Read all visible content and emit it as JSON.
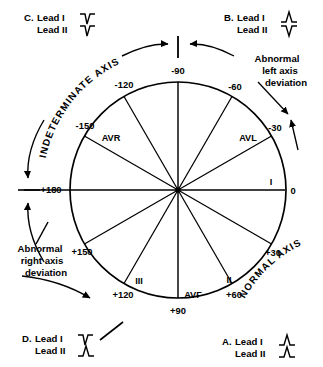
{
  "figure": {
    "circle": {
      "center_x": 178,
      "center_y": 190,
      "radius": 108
    },
    "degree_labels": [
      {
        "text": "-90",
        "angle": -90,
        "x": 178,
        "y": 74,
        "anchor": "middle"
      },
      {
        "text": "-120",
        "angle": -120,
        "x": 124,
        "y": 88,
        "anchor": "middle"
      },
      {
        "text": "-150",
        "angle": -150,
        "x": 85,
        "y": 129,
        "anchor": "middle"
      },
      {
        "text": "+180",
        "angle": 180,
        "x": 51,
        "y": 193,
        "anchor": "middle"
      },
      {
        "text": "+150",
        "angle": 150,
        "x": 82,
        "y": 255,
        "anchor": "middle"
      },
      {
        "text": "+120",
        "angle": 120,
        "x": 123,
        "y": 298,
        "anchor": "middle"
      },
      {
        "text": "+90",
        "angle": 90,
        "x": 178,
        "y": 313,
        "anchor": "middle"
      },
      {
        "text": "+60",
        "angle": 60,
        "x": 233,
        "y": 298,
        "anchor": "middle"
      },
      {
        "text": "+30",
        "angle": 30,
        "x": 272,
        "y": 256,
        "anchor": "middle"
      },
      {
        "text": "0",
        "angle": 0,
        "x": 292,
        "y": 194,
        "anchor": "middle"
      },
      {
        "text": "-30",
        "angle": -30,
        "x": 274,
        "y": 130,
        "anchor": "middle"
      },
      {
        "text": "-60",
        "angle": -60,
        "x": 234,
        "y": 89,
        "anchor": "middle"
      }
    ],
    "lead_labels": [
      {
        "text": "AVR",
        "angle": -150,
        "x": 111,
        "y": 138
      },
      {
        "text": "AVL",
        "angle": -30,
        "x": 247,
        "y": 139
      },
      {
        "text": "I",
        "angle": 0,
        "x": 271,
        "y": 185
      },
      {
        "text": "II",
        "angle": 60,
        "x": 228,
        "y": 281
      },
      {
        "text": "AVF",
        "angle": 90,
        "x": 192,
        "y": 296
      },
      {
        "text": "III",
        "angle": 120,
        "x": 139,
        "y": 282
      }
    ],
    "arc_texts": [
      {
        "text": "INDETERMINATE AXIS",
        "id": "indeterminate-axis-label"
      },
      {
        "text": "NORMAL AXIS",
        "id": "normal-axis-label"
      }
    ],
    "deviation_labels": [
      {
        "id": "abnormal-left-axis-deviation",
        "lines": [
          "Abnormal",
          "left axis",
          "deviation"
        ],
        "x": 277,
        "y": 64,
        "anchor": "middle"
      },
      {
        "id": "abnormal-right-axis-deviation",
        "lines": [
          "Abnormal",
          "right axis",
          "deviation"
        ],
        "x": 42,
        "y": 252,
        "anchor": "middle"
      }
    ],
    "cases": [
      {
        "id": "case-c",
        "label": "C.",
        "leads": [
          {
            "name": "Lead I",
            "morphology": "negative"
          },
          {
            "name": "Lead II",
            "morphology": "negative"
          }
        ],
        "x": 24,
        "y": 14,
        "corner": "top-left"
      },
      {
        "id": "case-b",
        "label": "B.",
        "leads": [
          {
            "name": "Lead I",
            "morphology": "positive"
          },
          {
            "name": "Lead II",
            "morphology": "negative"
          }
        ],
        "x": 225,
        "y": 14,
        "corner": "top-right"
      },
      {
        "id": "case-d",
        "label": "D.",
        "leads": [
          {
            "name": "Lead I",
            "morphology": "negative"
          },
          {
            "name": "Lead II",
            "morphology": "positive"
          }
        ],
        "x": 22,
        "y": 333,
        "corner": "bottom-left"
      },
      {
        "id": "case-a",
        "label": "A.",
        "leads": [
          {
            "name": "Lead I",
            "morphology": "positive"
          },
          {
            "name": "Lead II",
            "morphology": "positive"
          }
        ],
        "x": 222,
        "y": 337,
        "corner": "bottom-right"
      }
    ],
    "colors": {
      "ink": "#000000",
      "background": "#ffffff"
    }
  }
}
